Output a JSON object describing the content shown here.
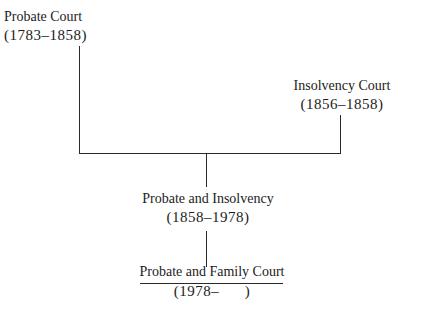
{
  "diagram": {
    "type": "lineage-tree",
    "nodes": [
      {
        "id": "probate",
        "name": "Probate Court",
        "dates": "(1783–1858)"
      },
      {
        "id": "insolvency",
        "name": "Insolvency Court",
        "dates": "(1856–1858)"
      },
      {
        "id": "probate_insolvency",
        "name": "Probate and Insolvency",
        "dates": "(1858–1978)"
      },
      {
        "id": "probate_family",
        "name": "Probate and Family Court",
        "dates": "(1978–      )"
      }
    ],
    "edges": [
      {
        "from": "probate",
        "to": "probate_insolvency"
      },
      {
        "from": "insolvency",
        "to": "probate_insolvency"
      },
      {
        "from": "probate_insolvency",
        "to": "probate_family"
      }
    ]
  }
}
